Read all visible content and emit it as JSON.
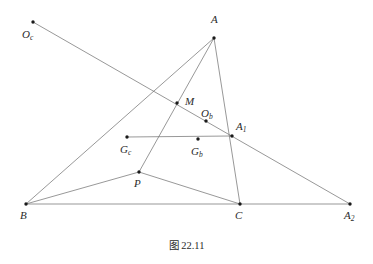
{
  "figure": {
    "caption": "图 22.11",
    "caption_x": 0,
    "caption_y": 237,
    "width": 373,
    "height": 264,
    "background_color": "#ffffff",
    "line_color": "#6b6b6b",
    "point_color": "#1a1a1a",
    "label_color": "#2b2b2b",
    "line_width": 0.7,
    "point_radius": 1.7
  },
  "chart_data": {
    "type": "diagram",
    "title": "图 22.11",
    "points": [
      {
        "id": "Oc",
        "label": "O",
        "sub": "c",
        "x": 33,
        "y": 22,
        "label_x": 22,
        "label_y": 29
      },
      {
        "id": "A",
        "label": "A",
        "sub": "",
        "x": 214,
        "y": 38,
        "label_x": 211,
        "label_y": 14
      },
      {
        "id": "M",
        "label": "M",
        "sub": "",
        "x": 177,
        "y": 103,
        "label_x": 185,
        "label_y": 96
      },
      {
        "id": "Ob",
        "label": "O",
        "sub": "b",
        "x": 206,
        "y": 121,
        "label_x": 201,
        "label_y": 108
      },
      {
        "id": "A1",
        "label": "A",
        "sub": "1",
        "x": 232,
        "y": 136,
        "label_x": 236,
        "label_y": 121
      },
      {
        "id": "Gc",
        "label": "G",
        "sub": "c",
        "x": 127,
        "y": 137,
        "label_x": 120,
        "label_y": 144
      },
      {
        "id": "Gb",
        "label": "G",
        "sub": "b",
        "x": 198,
        "y": 139,
        "label_x": 191,
        "label_y": 146
      },
      {
        "id": "P",
        "label": "P",
        "sub": "",
        "x": 139,
        "y": 172,
        "label_x": 134,
        "label_y": 178
      },
      {
        "id": "B",
        "label": "B",
        "sub": "",
        "x": 26,
        "y": 204,
        "label_x": 20,
        "label_y": 210
      },
      {
        "id": "C",
        "label": "C",
        "sub": "",
        "x": 240,
        "y": 204,
        "label_x": 235,
        "label_y": 210
      },
      {
        "id": "A2",
        "label": "A",
        "sub": "2",
        "x": 350,
        "y": 204,
        "label_x": 344,
        "label_y": 210
      }
    ],
    "segments": [
      {
        "id": "seg-B-A2",
        "from": "B",
        "to": "A2",
        "note": "base line B to A2 through C"
      },
      {
        "id": "seg-B-A",
        "from": "B",
        "to": "A",
        "note": "side BA"
      },
      {
        "id": "seg-A-C",
        "from": "A",
        "to": "C",
        "note": "side AC"
      },
      {
        "id": "seg-A-P",
        "from": "A",
        "to": "P",
        "note": "cevian from A through M to P"
      },
      {
        "id": "seg-B-P",
        "from": "B",
        "to": "P",
        "note": "segment BP"
      },
      {
        "id": "seg-P-C",
        "from": "P",
        "to": "C",
        "note": "segment PC"
      },
      {
        "id": "seg-Oc-A2",
        "from": "Oc",
        "to": "A2",
        "note": "transversal through M, Ob, A1"
      },
      {
        "id": "seg-Gc-A1",
        "from": "Gc",
        "to": "A1",
        "note": "horizontal segment through Gb"
      }
    ]
  }
}
